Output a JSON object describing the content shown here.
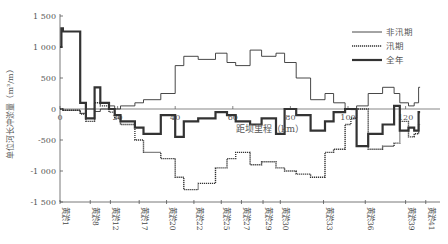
{
  "chart_data": {
    "type": "line",
    "step": true,
    "title": "",
    "xlabel": "距坝里程（km）",
    "ylabel": "单位河长冲淤量（m³/m）",
    "xlim": [
      0,
      130
    ],
    "ylim": [
      -1500,
      1500
    ],
    "x_ticks": [
      0,
      20,
      40,
      60,
      80,
      100,
      120
    ],
    "y_ticks": [
      1500,
      1000,
      500,
      0,
      -500,
      -1000,
      -1500
    ],
    "y_tick_labels": [
      "1 500",
      "1 000",
      "500",
      "0",
      "-500",
      "-1 000",
      "-1 500"
    ],
    "grid": false,
    "legend_position": "upper right",
    "legend": [
      "非汛期",
      "汛期",
      "全年"
    ],
    "section_labels": [
      {
        "name": "黄淤1",
        "km": 0
      },
      {
        "name": "黄淤8",
        "km": 10.5
      },
      {
        "name": "黄淤12",
        "km": 17.5
      },
      {
        "name": "黄淤17",
        "km": 27.5
      },
      {
        "name": "黄淤20",
        "km": 37
      },
      {
        "name": "黄淤22",
        "km": 46.5
      },
      {
        "name": "黄淤25",
        "km": 56
      },
      {
        "name": "黄淤27",
        "km": 63
      },
      {
        "name": "黄淤29",
        "km": 70.5
      },
      {
        "name": "黄淤30",
        "km": 76.5
      },
      {
        "name": "黄淤33",
        "km": 91.5
      },
      {
        "name": "黄淤36",
        "km": 106
      },
      {
        "name": "黄淤39",
        "km": 120
      },
      {
        "name": "黄淤41",
        "km": 127
      }
    ],
    "series": [
      {
        "name": "非汛期",
        "style": "solid-thin",
        "x": [
          0,
          1,
          2,
          7,
          9,
          12,
          14,
          17,
          19,
          21,
          26,
          29,
          35,
          40,
          43,
          48,
          54,
          58,
          61,
          66,
          70,
          75,
          78,
          82,
          87,
          92,
          95,
          99,
          101,
          103,
          107,
          112,
          116,
          118,
          121,
          123,
          124.5
        ],
        "values": [
          0,
          -20,
          -20,
          -70,
          0,
          -40,
          0,
          50,
          0,
          50,
          100,
          150,
          250,
          700,
          850,
          800,
          900,
          750,
          700,
          950,
          850,
          900,
          750,
          500,
          150,
          250,
          100,
          0,
          -10,
          50,
          250,
          350,
          250,
          100,
          50,
          100,
          350
        ]
      },
      {
        "name": "汛期",
        "style": "dotted",
        "x": [
          0,
          1,
          2,
          7,
          9,
          12,
          14,
          17,
          19,
          21,
          26,
          29,
          35,
          40,
          43,
          48,
          54,
          58,
          61,
          66,
          70,
          75,
          78,
          82,
          87,
          92,
          95,
          99,
          101,
          103,
          107,
          112,
          116,
          118,
          121,
          123,
          124.5
        ],
        "values": [
          0,
          -20,
          -20,
          -80,
          -200,
          100,
          50,
          -50,
          -150,
          -250,
          -500,
          -700,
          -800,
          -1100,
          -1300,
          -1200,
          -950,
          -800,
          -700,
          -900,
          -850,
          -950,
          -1000,
          -1050,
          -1100,
          -700,
          -650,
          -250,
          -150,
          0,
          -650,
          -600,
          -550,
          -200,
          -450,
          -400,
          -250
        ]
      },
      {
        "name": "全年",
        "style": "solid-thick",
        "x": [
          0,
          0.5,
          1,
          7,
          9,
          12,
          14,
          17,
          19,
          21,
          26,
          29,
          35,
          40,
          43,
          48,
          54,
          58,
          61,
          66,
          70,
          75,
          78,
          82,
          87,
          92,
          95,
          99,
          101,
          103,
          107,
          112,
          116,
          118,
          121,
          123,
          124.5
        ],
        "values": [
          1000,
          1300,
          1250,
          100,
          -150,
          350,
          100,
          0,
          -100,
          -200,
          -300,
          -400,
          -100,
          -450,
          -200,
          -150,
          -50,
          -100,
          -200,
          -250,
          -150,
          -400,
          0,
          -100,
          -350,
          -200,
          -50,
          0,
          0,
          -600,
          -400,
          -250,
          50,
          -350,
          -300,
          -350,
          -50
        ]
      }
    ]
  },
  "legend": {
    "items": [
      {
        "label": "非汛期",
        "style": "solid-thin"
      },
      {
        "label": "汛期",
        "style": "dotted"
      },
      {
        "label": "全年",
        "style": "solid-thick"
      }
    ]
  },
  "axes": {
    "ylabel": "单位河长冲淤量（m³/m）",
    "xlabel": "距坝里程（km）",
    "x_zero_label": "0"
  },
  "colors": {
    "line": "#333333",
    "axis": "#555555",
    "background": "#ffffff"
  }
}
